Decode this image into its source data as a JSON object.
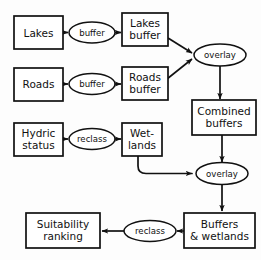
{
  "diagram": {
    "background_color": "#fdfdfd",
    "line_color": "#111111",
    "node_fill": "#ffffff",
    "boxes": [
      {
        "id": "lakes",
        "label_line1": "Lakes",
        "label_line2": ""
      },
      {
        "id": "lakes-buffer",
        "label_line1": "Lakes",
        "label_line2": "buffer"
      },
      {
        "id": "roads",
        "label_line1": "Roads",
        "label_line2": ""
      },
      {
        "id": "roads-buffer",
        "label_line1": "Roads",
        "label_line2": "buffer"
      },
      {
        "id": "combined-buffers",
        "label_line1": "Combined",
        "label_line2": "buffers"
      },
      {
        "id": "hydric-status",
        "label_line1": "Hydric",
        "label_line2": "status"
      },
      {
        "id": "wetlands",
        "label_line1": "Wet-",
        "label_line2": "lands"
      },
      {
        "id": "buffers-wetlands",
        "label_line1": "Buffers",
        "label_line2": "& wetlands"
      },
      {
        "id": "suitability",
        "label_line1": "Suitability",
        "label_line2": "ranking"
      }
    ],
    "processes": [
      {
        "id": "buffer-lakes",
        "label": "buffer"
      },
      {
        "id": "buffer-roads",
        "label": "buffer"
      },
      {
        "id": "overlay-top",
        "label": "overlay"
      },
      {
        "id": "reclass-hydric",
        "label": "reclass"
      },
      {
        "id": "overlay-bottom",
        "label": "overlay"
      },
      {
        "id": "reclass-final",
        "label": "reclass"
      }
    ],
    "flow": [
      "Lakes -> buffer -> Lakes buffer",
      "Roads -> buffer -> Roads buffer",
      "Lakes buffer -> overlay",
      "Roads buffer -> overlay",
      "overlay -> Combined buffers",
      "Hydric status -> reclass -> Wet-lands",
      "Combined buffers -> overlay",
      "Wet-lands -> overlay",
      "overlay -> Buffers & wetlands",
      "Buffers & wetlands -> reclass -> Suitability ranking"
    ]
  }
}
